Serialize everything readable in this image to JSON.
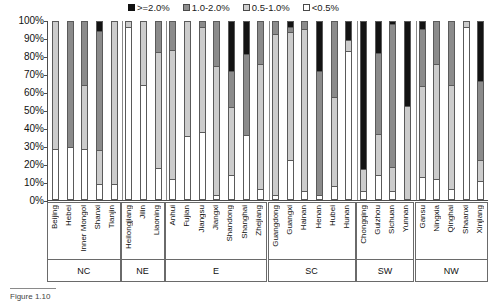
{
  "legend": {
    "position": "top-center",
    "items": [
      {
        "label": ">=2.0%",
        "key": "black",
        "color": "#131313"
      },
      {
        "label": "1.0-2.0%",
        "key": "dark",
        "color": "#8b8b8b"
      },
      {
        "label": "0.5-1.0%",
        "key": "light",
        "color": "#cccccc"
      },
      {
        "label": "<0.5%",
        "key": "white",
        "color": "#ffffff"
      }
    ]
  },
  "axis": {
    "y_ticks": [
      "100%",
      "90%",
      "80%",
      "70%",
      "60%",
      "50%",
      "40%",
      "30%",
      "20%",
      "10%",
      "0%"
    ]
  },
  "regions": [
    {
      "label": "NC",
      "count": 5
    },
    {
      "label": "NE",
      "count": 3
    },
    {
      "label": "E",
      "count": 7
    },
    {
      "label": "SC",
      "count": 6
    },
    {
      "label": "SW",
      "count": 4
    },
    {
      "label": "NW",
      "count": 5
    }
  ],
  "caption": {
    "text": "Figure 1.10"
  },
  "chart_data": {
    "type": "bar",
    "title": "",
    "xlabel": "",
    "ylabel": "",
    "ylim": [
      0,
      100
    ],
    "grid": false,
    "stacked": true,
    "stack_order_bottom_to_top": [
      "<0.5%",
      "0.5-1.0%",
      "1.0-2.0%",
      ">=2.0%"
    ],
    "categories": [
      "Beijing",
      "Hebei",
      "Inner Mongol",
      "Shanxi",
      "Tianjin",
      "Heilongjiang",
      "Jilin",
      "Liaoning",
      "Anhui",
      "Fujian",
      "Jiangsu",
      "Jiangxi",
      "Shandong",
      "Shanghai",
      "Zhejiang",
      "Guangdong",
      "Guangxi",
      "Hainan",
      "Henan",
      "Hubei",
      "Hunan",
      "Chongqing",
      "Guizhou",
      "Sichuan",
      "Yunnan",
      "Gansu",
      "Ningxia",
      "Qinghai",
      "Shaanxi",
      "Xinjiang"
    ],
    "series": [
      {
        "name": "<0.5%",
        "color": "#ffffff",
        "values": [
          28,
          29,
          28,
          8,
          8,
          97,
          64,
          17,
          11,
          35,
          38,
          2,
          13,
          36,
          5,
          2,
          22,
          4,
          2,
          7,
          84,
          4,
          13,
          4,
          0,
          12,
          11,
          5,
          97,
          10
        ]
      },
      {
        "name": "0.5-1.0%",
        "color": "#cccccc",
        "values": [
          72,
          0,
          36,
          19,
          92,
          3,
          36,
          66,
          73,
          65,
          59,
          73,
          39,
          0,
          71,
          91,
          73,
          92,
          0,
          50,
          6,
          12,
          23,
          13,
          52,
          52,
          65,
          59,
          3,
          11
        ]
      },
      {
        "name": "1.0-2.0%",
        "color": "#8b8b8b",
        "values": [
          0,
          71,
          36,
          68,
          0,
          0,
          0,
          17,
          16,
          0,
          3,
          25,
          20,
          46,
          24,
          7,
          2,
          4,
          70,
          43,
          0,
          0,
          46,
          82,
          0,
          32,
          24,
          36,
          0,
          45
        ]
      },
      {
        "name": ">=2.0%",
        "color": "#131313",
        "values": [
          0,
          0,
          0,
          5,
          0,
          0,
          0,
          0,
          0,
          0,
          0,
          0,
          28,
          18,
          0,
          0,
          3,
          0,
          28,
          0,
          10,
          84,
          18,
          1,
          48,
          4,
          0,
          0,
          0,
          34
        ]
      }
    ]
  }
}
